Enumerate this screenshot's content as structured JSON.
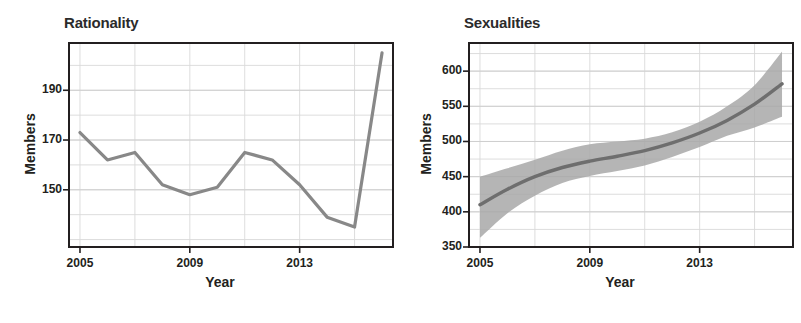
{
  "figure": {
    "width": 801,
    "height": 323,
    "background": "#ffffff",
    "line_color": "#888888",
    "band_color": "#a8a8a8",
    "axis_color": "#231f20",
    "grid_color": "#d9d9d9",
    "text_color": "#231f20"
  },
  "panels": [
    {
      "id": "rationality",
      "title": "Rationality",
      "xlabel": "Year",
      "ylabel": "Members",
      "x_ticks": [
        "2005",
        "2009",
        "2013"
      ],
      "y_ticks": [
        "150",
        "170",
        "190"
      ]
    },
    {
      "id": "sexualities",
      "title": "Sexualities",
      "xlabel": "Year",
      "ylabel": "Members",
      "x_ticks": [
        "2005",
        "2009",
        "2013"
      ],
      "y_ticks": [
        "350",
        "400",
        "450",
        "500",
        "550",
        "600"
      ]
    }
  ],
  "chart_data": [
    {
      "type": "line",
      "title": "Rationality",
      "xlabel": "Year",
      "ylabel": "Members",
      "x": [
        2005,
        2006,
        2007,
        2008,
        2009,
        2010,
        2011,
        2012,
        2013,
        2014,
        2015,
        2016
      ],
      "values": [
        173,
        162,
        165,
        152,
        148,
        151,
        165,
        162,
        152,
        139,
        135,
        205
      ],
      "xlim": [
        2004.6,
        2016.4
      ],
      "ylim": [
        127,
        209
      ],
      "x_ticks": [
        2005,
        2009,
        2013
      ],
      "y_ticks": [
        150,
        170,
        190
      ],
      "grid": true,
      "legend": "none",
      "series": [
        {
          "name": "Rationality members",
          "values": [
            173,
            162,
            165,
            152,
            148,
            151,
            165,
            162,
            152,
            139,
            135,
            205
          ]
        }
      ]
    },
    {
      "type": "line",
      "title": "Sexualities",
      "xlabel": "Year",
      "ylabel": "Members",
      "x": [
        2005,
        2006,
        2007,
        2008,
        2009,
        2010,
        2011,
        2012,
        2013,
        2014,
        2015,
        2016
      ],
      "values": [
        410,
        432,
        450,
        463,
        472,
        479,
        487,
        498,
        512,
        530,
        553,
        582
      ],
      "band_upper": [
        450,
        462,
        474,
        487,
        496,
        500,
        504,
        513,
        528,
        550,
        580,
        628
      ],
      "band_lower": [
        363,
        398,
        423,
        441,
        451,
        458,
        466,
        478,
        492,
        508,
        520,
        535
      ],
      "xlim": [
        2004.6,
        2016.4
      ],
      "ylim": [
        350,
        640
      ],
      "x_ticks": [
        2005,
        2009,
        2013
      ],
      "y_ticks": [
        350,
        400,
        450,
        500,
        550,
        600
      ],
      "grid": true,
      "legend": "none",
      "band_label": "confidence band"
    }
  ]
}
